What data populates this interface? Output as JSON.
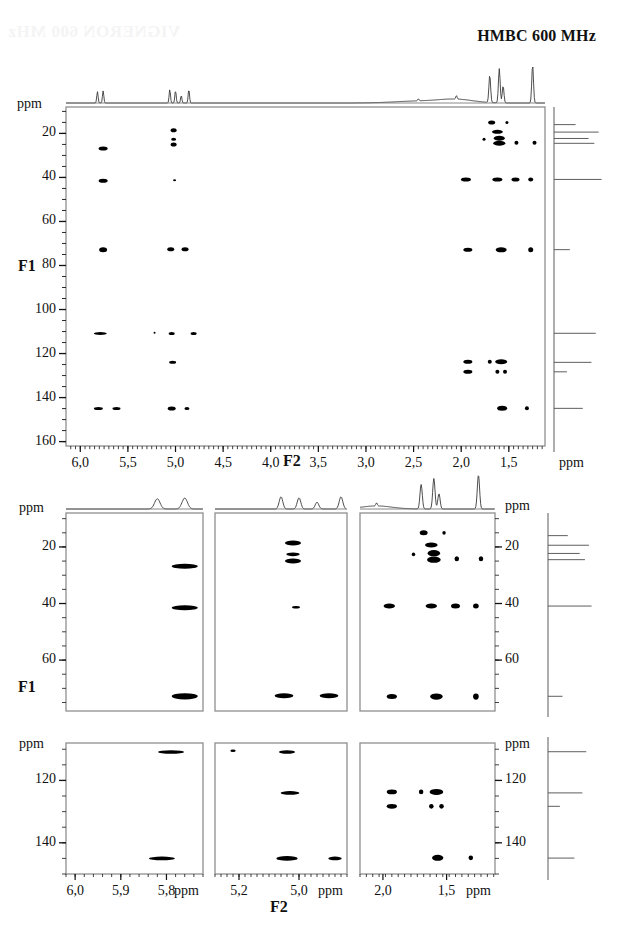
{
  "title": "HMBC 600 MHz",
  "watermark_text": "VIGNERON 600 MHz",
  "axis_titles": {
    "f1": "F1",
    "f2": "F2",
    "ppm": "ppm"
  },
  "main_panel": {
    "name": "main-hmbc-contour-plot",
    "x_axis": {
      "label": "F2",
      "unit": "ppm",
      "ticks": [
        "6,0",
        "5,5",
        "5,0",
        "4,5",
        "4,0",
        "3,5",
        "3,0",
        "2,5",
        "2,0",
        "1,5"
      ],
      "tick_values": [
        6.0,
        5.5,
        5.0,
        4.5,
        4.0,
        3.5,
        3.0,
        2.5,
        2.0,
        1.5
      ],
      "range": [
        6.15,
        1.12
      ]
    },
    "y_axis": {
      "label": "F1",
      "unit": "ppm",
      "ticks": [
        "20",
        "40",
        "60",
        "80",
        "100",
        "120",
        "140",
        "160"
      ],
      "tick_values": [
        20,
        40,
        60,
        80,
        100,
        120,
        140,
        160
      ],
      "range": [
        8,
        162
      ]
    }
  },
  "expansion_row_1": {
    "panels": [
      {
        "name": "expansion-panel-a",
        "x_ticks": [],
        "x_range": [
          6.02,
          5.72
        ],
        "y_range": [
          8,
          78
        ],
        "y_ticks": [
          "20",
          "40",
          "60"
        ],
        "y_tick_values": [
          20,
          40,
          60
        ]
      },
      {
        "name": "expansion-panel-b",
        "x_ticks": [],
        "x_range": [
          5.28,
          4.84
        ],
        "y_range": [
          8,
          78
        ],
        "y_ticks": [],
        "y_tick_values": []
      },
      {
        "name": "expansion-panel-c",
        "x_ticks": [],
        "x_range": [
          2.18,
          1.12
        ],
        "y_range": [
          8,
          78
        ],
        "y_ticks": [
          "20",
          "40",
          "60"
        ],
        "y_tick_values": [
          20,
          40,
          60
        ]
      }
    ],
    "left_unit": "ppm",
    "right_unit": "ppm"
  },
  "expansion_row_2": {
    "panels": [
      {
        "name": "expansion-panel-d",
        "x_ticks": [
          "6,0",
          "5,9",
          "5,8"
        ],
        "x_tick_values": [
          6.0,
          5.9,
          5.8
        ],
        "x_unit": "ppm",
        "x_range": [
          6.02,
          5.72
        ],
        "y_range": [
          108,
          150
        ],
        "y_ticks": [
          "120",
          "140"
        ],
        "y_tick_values": [
          120,
          140
        ]
      },
      {
        "name": "expansion-panel-e",
        "x_ticks": [
          "5,2",
          "5,0"
        ],
        "x_tick_values": [
          5.2,
          5.0
        ],
        "x_unit": "ppm",
        "x_range": [
          5.28,
          4.84
        ],
        "y_range": [
          108,
          150
        ],
        "y_ticks": [],
        "y_tick_values": []
      },
      {
        "name": "expansion-panel-f",
        "x_ticks": [
          "2,0",
          "1,5"
        ],
        "x_tick_values": [
          2.0,
          1.5
        ],
        "x_unit": "ppm",
        "x_range": [
          2.18,
          1.12
        ],
        "y_range": [
          108,
          150
        ],
        "y_ticks": [
          "120",
          "140"
        ],
        "y_tick_values": [
          120,
          140
        ]
      }
    ],
    "left_unit": "ppm",
    "right_unit": "ppm"
  },
  "chart_data": {
    "type": "scatter",
    "title": "HMBC 600 MHz",
    "xlabel": "F2",
    "ylabel": "F1",
    "xlim": [
      6.15,
      1.12
    ],
    "ylim": [
      162,
      8
    ],
    "grid": false,
    "legend": "none",
    "x_unit": "ppm",
    "y_unit": "ppm",
    "cross_peaks": [
      {
        "f2": 5.76,
        "f1": 26.8,
        "w": 9,
        "h": 4
      },
      {
        "f2": 5.76,
        "f1": 41.5,
        "w": 9,
        "h": 4
      },
      {
        "f2": 5.76,
        "f1": 72.8,
        "w": 8,
        "h": 5
      },
      {
        "f2": 5.79,
        "f1": 110.9,
        "w": 13,
        "h": 3
      },
      {
        "f2": 5.81,
        "f1": 145.0,
        "w": 9,
        "h": 3
      },
      {
        "f2": 5.62,
        "f1": 145.0,
        "w": 8,
        "h": 3
      },
      {
        "f2": 5.02,
        "f1": 18.6,
        "w": 6,
        "h": 4
      },
      {
        "f2": 5.02,
        "f1": 22.6,
        "w": 5,
        "h": 3
      },
      {
        "f2": 5.02,
        "f1": 25.0,
        "w": 6,
        "h": 4
      },
      {
        "f2": 5.01,
        "f1": 41.3,
        "w": 3,
        "h": 2
      },
      {
        "f2": 5.05,
        "f1": 72.6,
        "w": 7,
        "h": 4
      },
      {
        "f2": 4.9,
        "f1": 72.6,
        "w": 7,
        "h": 4
      },
      {
        "f2": 5.04,
        "f1": 110.9,
        "w": 6,
        "h": 3
      },
      {
        "f2": 4.81,
        "f1": 110.9,
        "w": 6,
        "h": 3
      },
      {
        "f2": 5.22,
        "f1": 110.5,
        "w": 2,
        "h": 2
      },
      {
        "f2": 5.03,
        "f1": 124.0,
        "w": 7,
        "h": 3
      },
      {
        "f2": 5.04,
        "f1": 145.0,
        "w": 8,
        "h": 4
      },
      {
        "f2": 4.88,
        "f1": 145.0,
        "w": 5,
        "h": 3
      },
      {
        "f2": 1.68,
        "f1": 15.0,
        "w": 7,
        "h": 4
      },
      {
        "f2": 1.52,
        "f1": 15.0,
        "w": 3,
        "h": 3
      },
      {
        "f2": 1.62,
        "f1": 19.3,
        "w": 11,
        "h": 4
      },
      {
        "f2": 1.6,
        "f1": 22.2,
        "w": 11,
        "h": 5
      },
      {
        "f2": 1.76,
        "f1": 22.6,
        "w": 3,
        "h": 3
      },
      {
        "f2": 1.6,
        "f1": 24.5,
        "w": 12,
        "h": 5
      },
      {
        "f2": 1.42,
        "f1": 24.2,
        "w": 4,
        "h": 4
      },
      {
        "f2": 1.23,
        "f1": 24.2,
        "w": 4,
        "h": 4
      },
      {
        "f2": 1.95,
        "f1": 40.9,
        "w": 10,
        "h": 4
      },
      {
        "f2": 1.62,
        "f1": 40.9,
        "w": 10,
        "h": 4
      },
      {
        "f2": 1.43,
        "f1": 40.9,
        "w": 8,
        "h": 4
      },
      {
        "f2": 1.27,
        "f1": 40.9,
        "w": 5,
        "h": 4
      },
      {
        "f2": 1.93,
        "f1": 72.9,
        "w": 9,
        "h": 4
      },
      {
        "f2": 1.58,
        "f1": 72.9,
        "w": 11,
        "h": 5
      },
      {
        "f2": 1.27,
        "f1": 72.9,
        "w": 5,
        "h": 5
      },
      {
        "f2": 1.93,
        "f1": 123.7,
        "w": 9,
        "h": 4
      },
      {
        "f2": 1.58,
        "f1": 123.7,
        "w": 12,
        "h": 5
      },
      {
        "f2": 1.7,
        "f1": 123.7,
        "w": 4,
        "h": 4
      },
      {
        "f2": 1.93,
        "f1": 128.3,
        "w": 9,
        "h": 4
      },
      {
        "f2": 1.62,
        "f1": 128.3,
        "w": 4,
        "h": 4
      },
      {
        "f2": 1.54,
        "f1": 128.3,
        "w": 4,
        "h": 4
      },
      {
        "f2": 1.57,
        "f1": 144.8,
        "w": 10,
        "h": 5
      },
      {
        "f2": 1.31,
        "f1": 144.8,
        "w": 4,
        "h": 4
      }
    ],
    "proton_projection_peaks": [
      {
        "ppm": 5.82,
        "height": 0.3
      },
      {
        "ppm": 5.76,
        "height": 0.32
      },
      {
        "ppm": 5.06,
        "height": 0.36
      },
      {
        "ppm": 5.0,
        "height": 0.33
      },
      {
        "ppm": 4.94,
        "height": 0.2
      },
      {
        "ppm": 4.86,
        "height": 0.36
      },
      {
        "ppm": 2.45,
        "height": 0.05
      },
      {
        "ppm": 2.05,
        "height": 0.09
      },
      {
        "ppm": 1.7,
        "height": 0.72
      },
      {
        "ppm": 1.6,
        "height": 0.9
      },
      {
        "ppm": 1.56,
        "height": 0.45
      },
      {
        "ppm": 1.25,
        "height": 1.0
      }
    ],
    "carbon_projection_peaks": [
      {
        "ppm": 16.0,
        "height": 0.3
      },
      {
        "ppm": 19.4,
        "height": 0.62
      },
      {
        "ppm": 22.3,
        "height": 0.48
      },
      {
        "ppm": 24.5,
        "height": 0.56
      },
      {
        "ppm": 40.9,
        "height": 0.66
      },
      {
        "ppm": 72.8,
        "height": 0.22
      },
      {
        "ppm": 110.8,
        "height": 0.58
      },
      {
        "ppm": 124.0,
        "height": 0.52
      },
      {
        "ppm": 128.3,
        "height": 0.18
      },
      {
        "ppm": 144.9,
        "height": 0.4
      }
    ]
  }
}
